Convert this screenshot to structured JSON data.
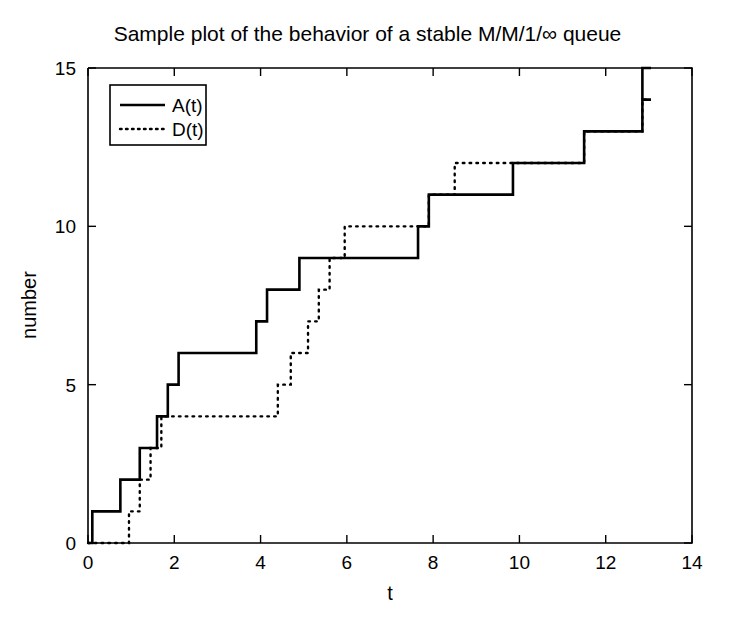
{
  "chart_data": {
    "type": "line",
    "title": "Sample plot of the behavior of a stable M/M/1/∞ queue",
    "xlabel": "t",
    "ylabel": "number",
    "xlim": [
      0,
      14
    ],
    "ylim": [
      0,
      15
    ],
    "xticks": [
      0,
      2,
      4,
      6,
      8,
      10,
      12,
      14
    ],
    "xticklabels": [
      "0",
      "2",
      "4",
      "6",
      "8",
      "10",
      "12",
      "14"
    ],
    "yticks": [
      0,
      5,
      10,
      15
    ],
    "yticklabels": [
      "0",
      "5",
      "10",
      "15"
    ],
    "grid": false,
    "legend_position": "upper left",
    "step_style": "post",
    "series": [
      {
        "name": "A(t)",
        "style": "solid",
        "jump_times": [
          0.1,
          0.75,
          1.2,
          1.6,
          1.85,
          2.1,
          3.9,
          4.15,
          4.9,
          7.65,
          7.9,
          9.85,
          11.5,
          12.85
        ],
        "values_after_jump": [
          1,
          2,
          3,
          4,
          5,
          6,
          7,
          8,
          9,
          10,
          11,
          12,
          13,
          14
        ],
        "x": [
          0.0,
          0.1,
          0.1,
          0.75,
          0.75,
          1.2,
          1.2,
          1.6,
          1.6,
          1.85,
          1.85,
          2.1,
          2.1,
          3.9,
          3.9,
          4.15,
          4.15,
          4.9,
          4.9,
          7.65,
          7.65,
          7.9,
          7.9,
          9.85,
          9.85,
          11.5,
          11.5,
          12.85,
          12.85,
          13.05
        ],
        "y": [
          0,
          0,
          1,
          1,
          2,
          2,
          3,
          3,
          4,
          4,
          5,
          5,
          6,
          6,
          7,
          7,
          8,
          8,
          9,
          9,
          10,
          10,
          11,
          11,
          12,
          12,
          13,
          13,
          14,
          14
        ]
      },
      {
        "name": "D(t)",
        "style": "dotted",
        "jump_times": [
          0.95,
          1.2,
          1.45,
          1.7,
          4.4,
          4.7,
          5.1,
          5.35,
          5.6,
          5.95,
          7.9,
          8.5,
          11.5,
          12.85
        ],
        "values_after_jump": [
          1,
          2,
          3,
          4,
          5,
          6,
          7,
          8,
          9,
          10,
          11,
          12,
          13,
          14
        ],
        "x": [
          0.0,
          0.95,
          0.95,
          1.2,
          1.2,
          1.45,
          1.45,
          1.7,
          1.7,
          4.4,
          4.4,
          4.7,
          4.7,
          5.1,
          5.1,
          5.35,
          5.35,
          5.6,
          5.6,
          5.95,
          5.95,
          7.9,
          7.9,
          8.5,
          8.5,
          11.5,
          11.5,
          12.85,
          12.85,
          13.05
        ],
        "y": [
          0,
          0,
          1,
          1,
          2,
          2,
          3,
          3,
          4,
          4,
          5,
          5,
          6,
          6,
          7,
          7,
          8,
          8,
          9,
          9,
          10,
          10,
          11,
          11,
          12,
          12,
          13,
          13,
          14,
          14
        ]
      }
    ],
    "final_spike": {
      "x": 12.85,
      "from": 14,
      "to": 15,
      "series": "A(t)"
    },
    "colors": {
      "axis": "#000000",
      "series_a": "#000000",
      "series_d": "#000000",
      "background": "#ffffff"
    }
  },
  "legend": {
    "entries": [
      {
        "label": "A(t)",
        "style": "solid"
      },
      {
        "label": "D(t)",
        "style": "dotted"
      }
    ]
  }
}
